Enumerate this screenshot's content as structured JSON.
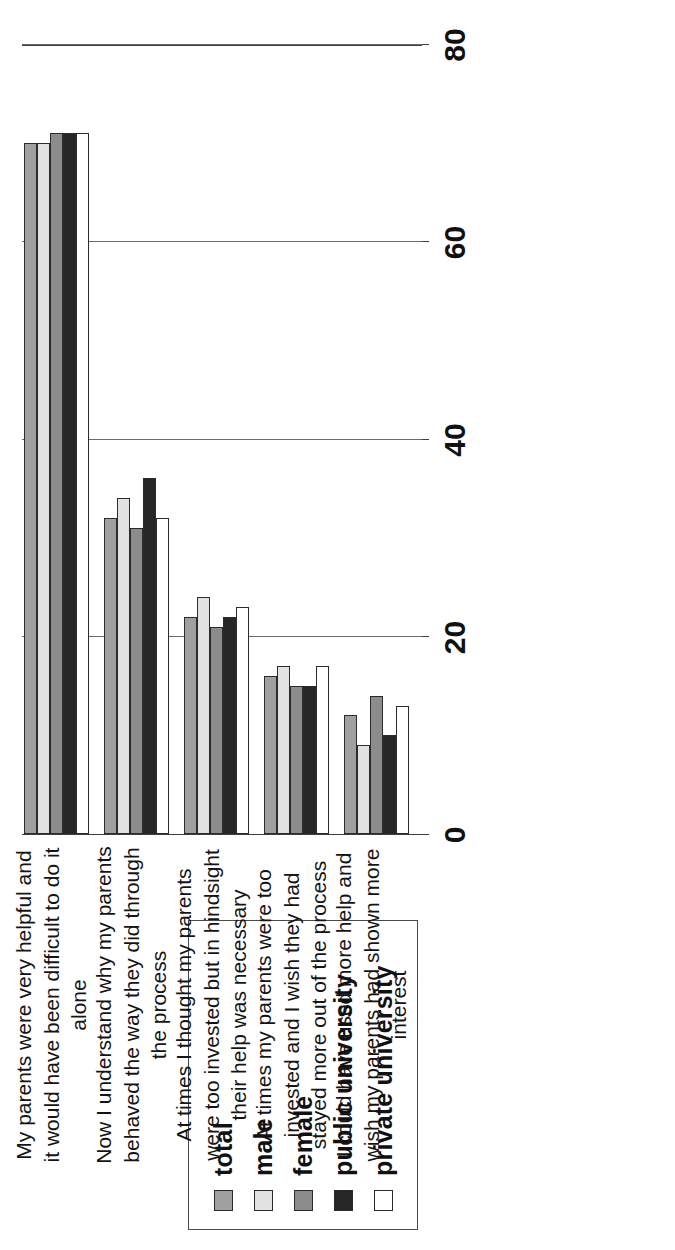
{
  "legend": {
    "entries": [
      {
        "label": "total",
        "color": "#a0a0a0",
        "swatch_name": "legend-swatch-total"
      },
      {
        "label": "male",
        "color": "#e2e2e2",
        "swatch_name": "legend-swatch-male"
      },
      {
        "label": "female",
        "color": "#8c8c8c",
        "swatch_name": "legend-swatch-female"
      },
      {
        "label": "public university",
        "color": "#262626",
        "swatch_name": "legend-swatch-public-university"
      },
      {
        "label": "private university",
        "color": "#ffffff",
        "swatch_name": "legend-swatch-private-university"
      }
    ]
  },
  "axis": {
    "ticks": [
      "0",
      "20",
      "40",
      "60",
      "80"
    ],
    "tick_values": [
      0,
      20,
      40,
      60,
      80
    ]
  },
  "chart_data": {
    "type": "bar",
    "title": "",
    "subtitle": "",
    "xlabel": "",
    "ylabel": "",
    "orientation": "rotated-90-grouped-vertical",
    "grid": true,
    "legend_position": "top-left-rotated",
    "ylim": [
      0,
      80
    ],
    "yticks": [
      0,
      20,
      40,
      60,
      80
    ],
    "categories": [
      "My parents were very helpful and it would have been difficult to do it alone",
      "Now I understand why my parents behaved the way they did through the process",
      "At times I thought my parents were too invested but in hindsight their help was necessary",
      "At times my parents were too invested and I wish they had stayed more out of the process",
      "I could have used more help and wish my parents had shown more interest"
    ],
    "series": [
      {
        "name": "total",
        "color": "#a0a0a0",
        "values": [
          70,
          32,
          22,
          16,
          12
        ]
      },
      {
        "name": "male",
        "color": "#e2e2e2",
        "values": [
          70,
          34,
          24,
          17,
          9
        ]
      },
      {
        "name": "female",
        "color": "#8c8c8c",
        "values": [
          71,
          31,
          21,
          15,
          14
        ]
      },
      {
        "name": "public university",
        "color": "#262626",
        "values": [
          71,
          36,
          22,
          15,
          10
        ]
      },
      {
        "name": "private university",
        "color": "#ffffff",
        "values": [
          71,
          32,
          23,
          17,
          13
        ]
      }
    ]
  }
}
